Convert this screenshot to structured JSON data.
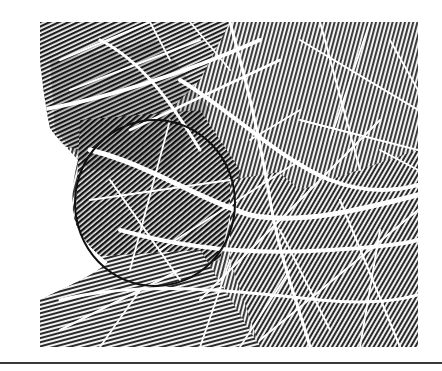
{
  "image": {
    "subject": "palm print",
    "description": "Grayscale palmprint with visible friction ridges and white flexion creases; a black circle marks a region on the left side",
    "colors": {
      "background": "#ffffff",
      "ridge": "#1e1e1e",
      "ridge_mid": "#5a5a5a",
      "crease": "#ffffff",
      "annotation": "#111111",
      "rule": "#3a3a3a"
    },
    "print_bounds": {
      "x": 40,
      "y": 22,
      "width": 378,
      "height": 325
    },
    "annotation_circle": {
      "cx": 155,
      "cy": 203,
      "rx": 80,
      "ry": 83,
      "stroke_width": 2
    },
    "bottom_rule": {
      "y": 362,
      "height": 2
    }
  }
}
